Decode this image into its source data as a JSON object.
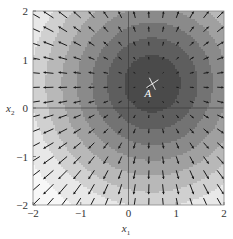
{
  "chart_data": {
    "type": "contour+quiver",
    "title": "",
    "xlabel": "x1",
    "ylabel": "x2",
    "xlabel_main": "x",
    "xlabel_sub": "1",
    "ylabel_main": "x",
    "ylabel_sub": "2",
    "xlim": [
      -2,
      2
    ],
    "ylim": [
      -2,
      2
    ],
    "xticks": [
      -2,
      -1,
      0,
      1,
      2
    ],
    "yticks": [
      -2,
      -1,
      0,
      1,
      2
    ],
    "xtick_labels": [
      "−2",
      "−1",
      "0",
      "1",
      "2"
    ],
    "ytick_labels": [
      "−2",
      "−1",
      "0",
      "1",
      "2"
    ],
    "grid": false,
    "reference_lines": {
      "x": 0,
      "y": 0
    },
    "function": "f(x1,x2) = (x1-0.5)^2 + (x2-0.5)^2",
    "minimum_point": {
      "label": "A",
      "x1": 0.5,
      "x2": 0.5,
      "marker": "cross"
    },
    "contour_levels": [
      0.35,
      0.9,
      1.6,
      2.5,
      3.6,
      5.0,
      6.5,
      9.0,
      12.5
    ],
    "contour_colors": [
      "#4a4a4a",
      "#5e5e5e",
      "#737373",
      "#8a8a8a",
      "#a0a0a0",
      "#b8b8b8",
      "#d0d0d0",
      "#e8e8e8",
      "#f7f7f7",
      "#9a9a9a"
    ],
    "quiver": {
      "grid_count": 14,
      "range": [
        -2,
        2
      ],
      "direction": "gradient",
      "color": "#1a1a1a"
    }
  }
}
